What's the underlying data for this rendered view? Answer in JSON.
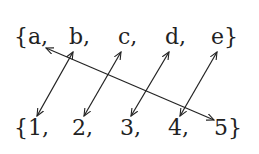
{
  "domain_set": {
    "elements": [
      "{a,",
      "b,",
      "c,",
      "d,",
      "e}"
    ]
  },
  "codomain_set": {
    "elements": [
      "{1,",
      "2,",
      "3,",
      "4,",
      "5}"
    ]
  },
  "mappings": [
    {
      "from": "a",
      "to": "5"
    },
    {
      "from": "b",
      "to": "1"
    },
    {
      "from": "c",
      "to": "2"
    },
    {
      "from": "d",
      "to": "3"
    },
    {
      "from": "e",
      "to": "4"
    }
  ],
  "arrow_style": "double-headed",
  "colors": {
    "ink": "#222222",
    "background": "#ffffff"
  }
}
